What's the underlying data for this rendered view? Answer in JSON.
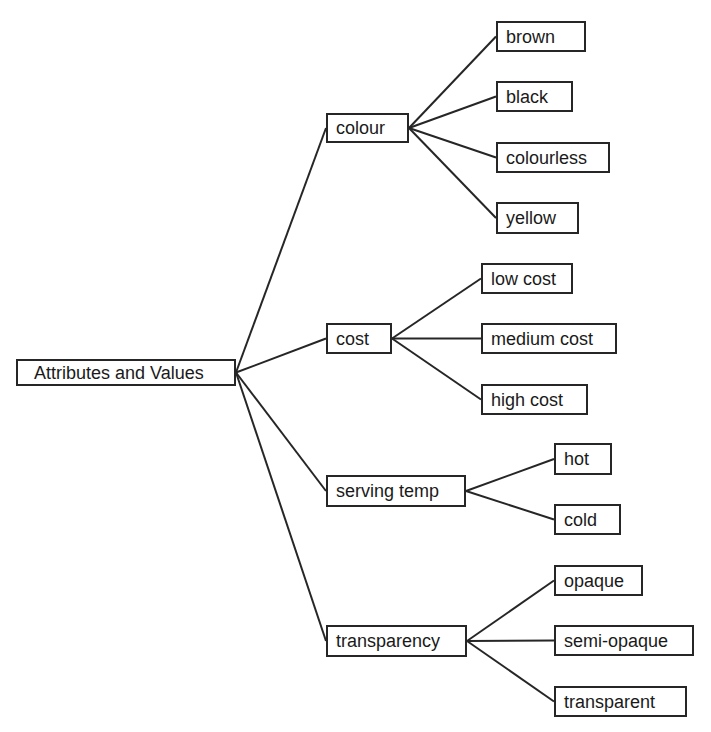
{
  "diagram": {
    "type": "tree",
    "root": {
      "label": "Attributes and Values",
      "box": [
        16,
        359,
        236,
        386
      ]
    },
    "attributes": [
      {
        "label": "colour",
        "box": [
          326,
          113,
          409,
          143
        ],
        "values": [
          {
            "label": "brown",
            "box": [
              496,
              21,
              586,
              52
            ]
          },
          {
            "label": "black",
            "box": [
              496,
              81,
              573,
              112
            ]
          },
          {
            "label": "colourless",
            "box": [
              496,
              142,
              610,
              173
            ]
          },
          {
            "label": "yellow",
            "box": [
              496,
              202,
              579,
              234
            ]
          }
        ]
      },
      {
        "label": "cost",
        "box": [
          326,
          323,
          392,
          354
        ],
        "values": [
          {
            "label": "low cost",
            "box": [
              481,
              263,
              573,
              294
            ]
          },
          {
            "label": "medium cost",
            "box": [
              481,
              323,
              617,
              354
            ]
          },
          {
            "label": "high cost",
            "box": [
              481,
              384,
              588,
              415
            ]
          }
        ]
      },
      {
        "label": "serving temp",
        "box": [
          326,
          475,
          466,
          507
        ],
        "values": [
          {
            "label": "hot",
            "box": [
              554,
              443,
              612,
              475
            ]
          },
          {
            "label": "cold",
            "box": [
              554,
              504,
              621,
              535
            ]
          }
        ]
      },
      {
        "label": "transparency",
        "box": [
          326,
          625,
          467,
          657
        ],
        "values": [
          {
            "label": "opaque",
            "box": [
              554,
              565,
              643,
              596
            ]
          },
          {
            "label": "semi-opaque",
            "box": [
              554,
              625,
              694,
              656
            ]
          },
          {
            "label": "transparent",
            "box": [
              554,
              686,
              687,
              717
            ]
          }
        ]
      }
    ],
    "colors": {
      "line": "#262626",
      "border": "#262626",
      "text": "#1a1a1a",
      "background": "#ffffff"
    }
  }
}
